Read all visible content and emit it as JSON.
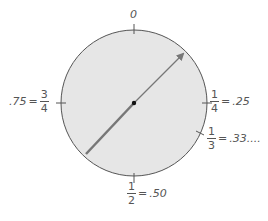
{
  "diagram": {
    "type": "fraction-circle-spinner",
    "colors": {
      "circle_fill": "#e6e6e6",
      "circle_stroke": "#555555",
      "arrow": "#777777",
      "text": "#555555",
      "center_dot": "#111111"
    },
    "labels": {
      "top": {
        "text": "0"
      },
      "right": {
        "numerator": "1",
        "denominator": "4",
        "equals": "=",
        "decimal": ".25"
      },
      "lower_right": {
        "numerator": "1",
        "denominator": "3",
        "equals": "=",
        "decimal": ".33...."
      },
      "bottom": {
        "numerator": "1",
        "denominator": "2",
        "equals": "=",
        "decimal": ".50"
      },
      "left": {
        "decimal": ".75",
        "equals": "=",
        "numerator": "3",
        "denominator": "4"
      }
    }
  }
}
